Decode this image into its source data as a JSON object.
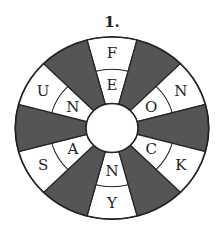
{
  "title": "1.",
  "wheel": {
    "colors": {
      "dark": "#555555",
      "light": "#ffffff",
      "stroke": "#222222"
    },
    "center": [
      112,
      128
    ],
    "radii": {
      "outer": 93,
      "middle": 60,
      "inner": 25
    },
    "segments": [
      {
        "position": "top",
        "angle": 90,
        "outer": "F",
        "inner": "E"
      },
      {
        "position": "upper-right",
        "angle": 30,
        "outer": "N",
        "inner": "O"
      },
      {
        "position": "lower-right",
        "angle": -30,
        "outer": "K",
        "inner": "C"
      },
      {
        "position": "bottom",
        "angle": -90,
        "outer": "Y",
        "inner": "N"
      },
      {
        "position": "lower-left",
        "angle": -150,
        "outer": "S",
        "inner": "A"
      },
      {
        "position": "upper-left",
        "angle": 150,
        "outer": "U",
        "inner": "N"
      }
    ]
  }
}
